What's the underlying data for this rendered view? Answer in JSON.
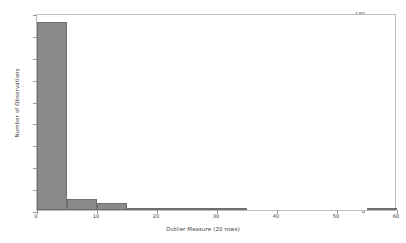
{
  "chart_data": {
    "type": "bar",
    "title": "",
    "subtitle": "",
    "xlabel": "Outlier Measure (20 rows)",
    "ylabel": "Number of Observations",
    "xlim": [
      0,
      60
    ],
    "ylim": [
      0,
      180
    ],
    "bin_width": 5,
    "grid": false,
    "legend": null,
    "bar_color": "#8a8a8a",
    "bar_edge_color": "#6f6f6f",
    "xticks": [
      0,
      10,
      20,
      30,
      40,
      50,
      60
    ],
    "xtick_labels": [
      "0",
      "10",
      "20",
      "30",
      "40",
      "50",
      "60"
    ],
    "yticks": [
      0,
      20,
      40,
      60,
      80,
      100,
      120,
      140,
      160,
      180
    ],
    "ytick_labels": [
      "0",
      "20",
      "40",
      "60",
      "80",
      "100",
      "120",
      "140",
      "160",
      "180"
    ],
    "categories": [
      "0-5",
      "5-10",
      "10-15",
      "15-20",
      "20-25",
      "25-30",
      "30-35",
      "35-40",
      "40-45",
      "45-50",
      "50-55",
      "55-60"
    ],
    "bin_edges": [
      0,
      5,
      10,
      15,
      20,
      25,
      30,
      35,
      40,
      45,
      50,
      55,
      60
    ],
    "values": [
      172,
      10,
      6,
      2,
      2,
      1,
      1,
      0,
      0,
      0,
      0,
      2
    ]
  },
  "axes": {
    "x_title": "Outlier Measure (20 rows)",
    "y_title": "Number of Observations"
  }
}
